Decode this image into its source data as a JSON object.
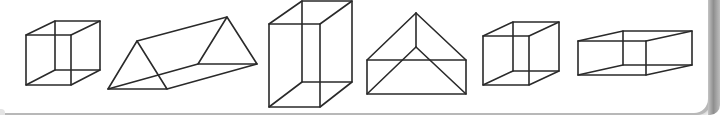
{
  "figure": {
    "title": "",
    "stroke_color": "#2a2a2a",
    "background": "#ffffff",
    "shapes": [
      {
        "id": "cube-1",
        "kind": "cube"
      },
      {
        "id": "triangular-prism",
        "kind": "triangular-prism"
      },
      {
        "id": "tall-box",
        "kind": "rectangular-prism-tall"
      },
      {
        "id": "roof-prism",
        "kind": "triangular-prism-front-view"
      },
      {
        "id": "cube-2",
        "kind": "cube"
      },
      {
        "id": "flat-box",
        "kind": "rectangular-prism-flat"
      }
    ]
  }
}
